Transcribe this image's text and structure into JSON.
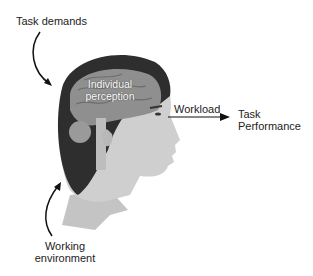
{
  "diagram": {
    "labels": {
      "task_demands": "Task demands",
      "individual_perception_line1": "Individual",
      "individual_perception_line2": "perception",
      "workload": "Workload",
      "task_performance_line1": "Task",
      "task_performance_line2": "Performance",
      "working_environment_line1": "Working",
      "working_environment_line2": "environment"
    },
    "colors": {
      "skin": "#c9c9c9",
      "hair": "#2a2a2a",
      "brain": "#8a8a8a",
      "arrow": "#111111"
    }
  }
}
